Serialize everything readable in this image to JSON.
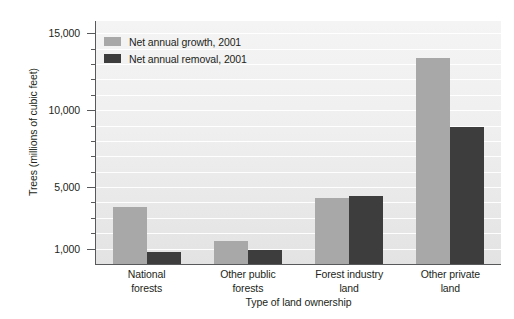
{
  "chart_data": {
    "type": "bar",
    "title": "",
    "xlabel": "Type of land ownership",
    "ylabel": "Trees (millions of cubic feet)",
    "categories": [
      "National\nforests",
      "Other public\nforests",
      "Forest industry\nland",
      "Other private\nland"
    ],
    "category_lines": [
      [
        "National",
        "forests"
      ],
      [
        "Other public",
        "forests"
      ],
      [
        "Forest industry",
        "land"
      ],
      [
        "Other private",
        "land"
      ]
    ],
    "series": [
      {
        "name": "Net annual growth, 2001",
        "color": "#a8a8a8",
        "values": [
          3700,
          1500,
          4300,
          13400
        ]
      },
      {
        "name": "Net annual removal, 2001",
        "color": "#3d3d3d",
        "values": [
          800,
          900,
          4450,
          8900
        ]
      }
    ],
    "ylim": [
      0,
      15000
    ],
    "ytick_major": [
      1000,
      5000,
      10000,
      15000
    ],
    "ytick_major_labels": [
      "1,000",
      "5,000",
      "10,000",
      "15,000"
    ],
    "ytick_minor": [
      2000,
      3000,
      4000,
      6000,
      7000,
      8000,
      9000,
      11000,
      12000,
      13000,
      14000
    ],
    "grid": true,
    "grid_color": "#ffffff",
    "legend_position": "top-left",
    "plot_background": "#efefef",
    "axis_color": "#58595b",
    "text_color": "#231f20"
  },
  "legend": {
    "items": [
      {
        "label": "Net annual growth, 2001",
        "swatch": "growth"
      },
      {
        "label": "Net annual removal, 2001",
        "swatch": "removal"
      }
    ]
  }
}
